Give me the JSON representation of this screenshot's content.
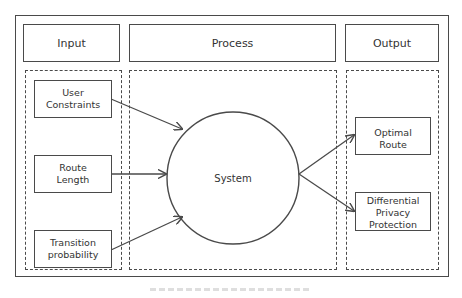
{
  "diagram": {
    "headers": {
      "input": "Input",
      "process": "Process",
      "output": "Output"
    },
    "inputs": [
      {
        "label": "User Constraints",
        "line1": "User",
        "line2": "Constraints"
      },
      {
        "label": "Route Length",
        "line1": "Route",
        "line2": "Length"
      },
      {
        "label": "Transition probability",
        "line1": "Transition",
        "line2": "probability"
      }
    ],
    "process": {
      "node_label": "System",
      "shape": "circle"
    },
    "outputs": [
      {
        "label": "Optimal Route",
        "line1": "Optimal",
        "line2": "Route"
      },
      {
        "label": "Differential Privacy Protection",
        "line1": "Differential",
        "line2": "Privacy",
        "line3": "Protection"
      }
    ],
    "edges": [
      {
        "from": "User Constraints",
        "to": "System"
      },
      {
        "from": "Route Length",
        "to": "System"
      },
      {
        "from": "Transition probability",
        "to": "System"
      },
      {
        "from": "System",
        "to": "Optimal Route"
      },
      {
        "from": "System",
        "to": "Differential Privacy Protection"
      }
    ],
    "colors": {
      "stroke": "#4a4a4a",
      "text": "#333333",
      "background": "#ffffff"
    }
  }
}
